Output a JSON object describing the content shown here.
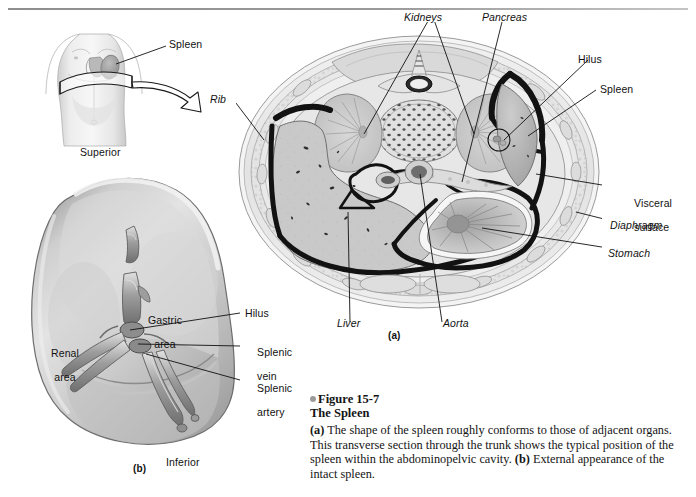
{
  "figure": {
    "number": "Figure 15-7",
    "title": "The Spleen",
    "caption_a_marker": "(a)",
    "caption_a_text": " The shape of the spleen roughly conforms to those of adjacent organs. This transverse section through the trunk shows the typical position of the spleen within the abdominopelvic cavity. ",
    "caption_b_marker": "(b)",
    "caption_b_text": " External appearance of the intact spleen."
  },
  "panel_markers": {
    "a": "(a)",
    "b": "(b)"
  },
  "inset": {
    "label_spleen": "Spleen"
  },
  "cross_section": {
    "labels": {
      "kidneys": "Kidneys",
      "pancreas": "Pancreas",
      "hilus": "Hilus",
      "spleen": "Spleen",
      "rib": "Rib",
      "visceral_surface_line1": "Visceral",
      "visceral_surface_line2": "surface",
      "diaphragm": "Diaphragm",
      "stomach": "Stomach",
      "liver": "Liver",
      "aorta": "Aorta"
    },
    "italic_labels": [
      "Kidneys",
      "Pancreas",
      "Rib",
      "Diaphragm",
      "Stomach",
      "Liver",
      "Aorta"
    ]
  },
  "spleen_detail": {
    "labels": {
      "superior": "Superior",
      "inferior": "Inferior",
      "gastric_area_line1": "Gastric",
      "gastric_area_line2": "area",
      "renal_area_line1": "Renal",
      "renal_area_line2": "area",
      "hilus": "Hilus",
      "splenic_vein_line1": "Splenic",
      "splenic_vein_line2": "vein",
      "splenic_artery_line1": "Splenic",
      "splenic_artery_line2": "artery"
    }
  },
  "colors": {
    "page_background": "#ffffff",
    "ink": "#111111",
    "rule": "#8e8e8e",
    "bullet": "#9b9b9b",
    "organ_light": "#d8d8d8",
    "organ_mid": "#b8b8b8",
    "organ_dark": "#8d8d8d",
    "cavity_line": "#1a1a1a",
    "body_wall": "#e9e9e9"
  }
}
